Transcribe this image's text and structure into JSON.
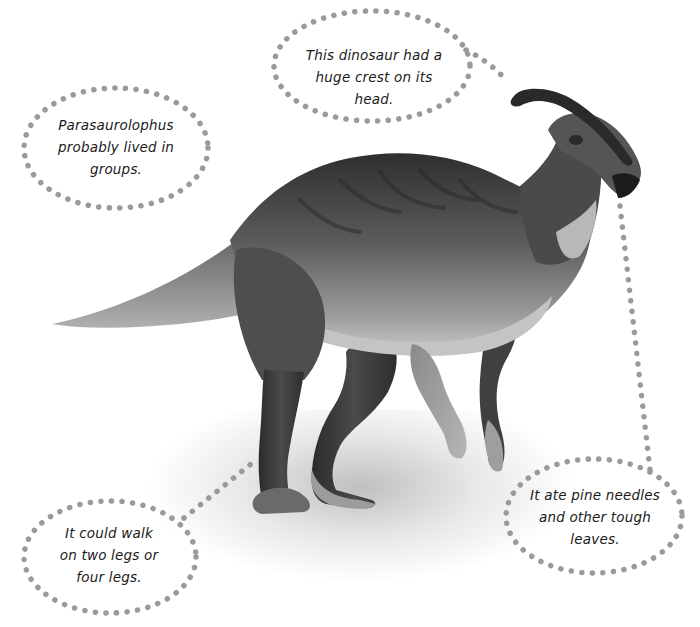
{
  "subject": "Parasaurolophus",
  "callouts": [
    {
      "id": "groups",
      "lines": [
        "Parasaurolophus",
        "probably lived in",
        "groups."
      ]
    },
    {
      "id": "crest",
      "lines": [
        "This dinosaur had a",
        "huge crest on its",
        "head."
      ]
    },
    {
      "id": "walk",
      "lines": [
        "It could walk",
        "on two legs or",
        "four legs."
      ]
    },
    {
      "id": "diet",
      "lines": [
        "It ate pine needles",
        "and other tough",
        "leaves."
      ]
    }
  ],
  "colors": {
    "dots": "#9a9a9a",
    "text": "#1a1a1a",
    "skin_dark": "#3a3a3a",
    "skin_mid": "#6e6e6e",
    "skin_light": "#bdbdbd",
    "background": "#ffffff"
  }
}
